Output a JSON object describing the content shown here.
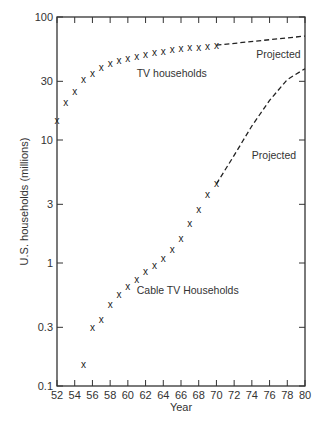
{
  "chart_data": {
    "type": "scatter",
    "title": "",
    "xlabel": "Year",
    "ylabel": "U.S. households (millions)",
    "yscale": "log",
    "xlim": [
      52,
      80
    ],
    "ylim": [
      0.1,
      100
    ],
    "x_ticks": [
      52,
      54,
      56,
      58,
      60,
      62,
      64,
      66,
      68,
      70,
      72,
      74,
      76,
      78,
      80
    ],
    "y_ticks": [
      0.1,
      0.3,
      1,
      3,
      10,
      30,
      100
    ],
    "y_tick_labels": [
      "0.1",
      "0.3",
      "1",
      "3",
      "10",
      "30",
      "100"
    ],
    "grid": false,
    "marker": "x",
    "series": [
      {
        "name": "TV households",
        "x": [
          52,
          53,
          54,
          55,
          56,
          57,
          58,
          59,
          60,
          61,
          62,
          63,
          64,
          65,
          66,
          67,
          68,
          69,
          70
        ],
        "values": [
          14.5,
          20,
          25,
          31,
          34.5,
          38.5,
          41.5,
          44,
          46,
          48,
          49.5,
          51,
          52.5,
          54,
          55,
          56,
          57,
          58,
          59
        ],
        "projection": {
          "label": "Projected",
          "x": [
            70,
            80
          ],
          "values": [
            59,
            70
          ]
        }
      },
      {
        "name": "Cable TV Households",
        "x": [
          55,
          56,
          57,
          58,
          59,
          60,
          61,
          62,
          63,
          64,
          65,
          66,
          67,
          68,
          69,
          70
        ],
        "values": [
          0.15,
          0.3,
          0.35,
          0.46,
          0.55,
          0.64,
          0.74,
          0.86,
          0.96,
          1.08,
          1.28,
          1.57,
          2.1,
          2.7,
          3.6,
          4.4
        ],
        "projection": {
          "label": "Projected",
          "x": [
            70,
            72,
            74,
            76,
            78,
            80
          ],
          "values": [
            4.4,
            7.5,
            13,
            21,
            31,
            38
          ]
        }
      }
    ],
    "annotations": [
      {
        "text": "TV households",
        "x": 61,
        "y": 35
      },
      {
        "text": "Projected",
        "x": 74.5,
        "y": 50
      },
      {
        "text": "Projected",
        "x": 74,
        "y": 7.5
      },
      {
        "text": "Cable TV Households",
        "x": 61,
        "y": 0.6
      }
    ]
  }
}
